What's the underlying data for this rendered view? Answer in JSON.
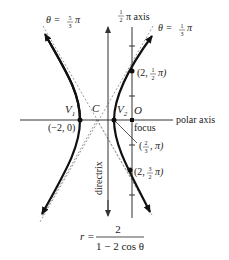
{
  "diagram": {
    "type": "polar-hyperbola",
    "equation": {
      "lhs": "r =",
      "numerator": "2",
      "denominator": "1 − 2 cos θ"
    },
    "axes": {
      "polar_axis_label": "polar axis",
      "half_pi_axis_label": "π axis",
      "half_pi_axis_frac": {
        "num": "1",
        "den": "2"
      }
    },
    "asymptotes": [
      {
        "label_prefix": "θ =",
        "frac": {
          "num": "5",
          "den": "3"
        },
        "suffix": "π"
      },
      {
        "label_prefix": "θ =",
        "frac": {
          "num": "1",
          "den": "3"
        },
        "suffix": "π"
      }
    ],
    "labels": {
      "directrix": "directrix",
      "focus": "focus",
      "origin": "O",
      "center": "C",
      "v1": "V",
      "v1_sub": "1",
      "v2": "V",
      "v2_sub": "2"
    },
    "points": [
      {
        "name": "V1",
        "label": "(−2, 0)"
      },
      {
        "name": "V2",
        "label": ""
      },
      {
        "name": "top",
        "label_pre": "(2, ",
        "frac": {
          "num": "1",
          "den": "2"
        },
        "label_post": "π)"
      },
      {
        "name": "mid",
        "label_pre": "(",
        "frac": {
          "num": "2",
          "den": "3"
        },
        "label_post": ", π)"
      },
      {
        "name": "bottom",
        "label_pre": "(2, ",
        "frac": {
          "num": "3",
          "den": "2"
        },
        "label_post": "π)"
      }
    ],
    "colors": {
      "curve": "#111111",
      "axis": "#333333",
      "asymptote": "#999999"
    }
  }
}
